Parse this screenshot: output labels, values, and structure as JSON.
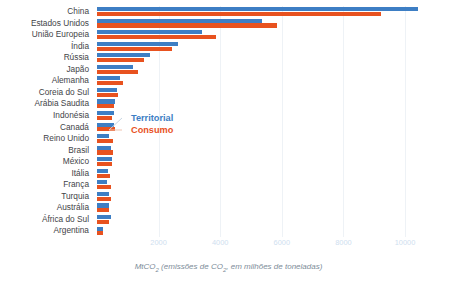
{
  "chart_data": {
    "type": "bar",
    "orientation": "horizontal",
    "title": "",
    "xlabel": "MtCO₂ (emissões de CO₂, em milhões de toneladas)",
    "ylabel": "",
    "xlim": [
      0,
      11200
    ],
    "xticks": [
      2000,
      4000,
      6000,
      8000,
      10000
    ],
    "xticklabels": [
      "2000",
      "4000",
      "6000",
      "8000",
      "10000"
    ],
    "grid": "vertical",
    "legend_position": "inside-left",
    "categories": [
      "China",
      "Estados Unidos",
      "União Europeia",
      "Índia",
      "Rússia",
      "Japão",
      "Alemanha",
      "Coreia do Sul",
      "Arábia Saudita",
      "Indonésia",
      "Canadá",
      "Reino Unido",
      "Brasil",
      "México",
      "Itália",
      "França",
      "Turquia",
      "Austrália",
      "África do Sul",
      "Argentina"
    ],
    "series": [
      {
        "name": "Territorial",
        "color": "#3d7ec4",
        "values": [
          10430,
          5350,
          3400,
          2620,
          1710,
          1180,
          760,
          640,
          570,
          560,
          560,
          400,
          470,
          480,
          350,
          330,
          400,
          400,
          450,
          200
        ]
      },
      {
        "name": "Consumo",
        "color": "#e8521f",
        "values": [
          9210,
          5830,
          3860,
          2450,
          1540,
          1340,
          850,
          680,
          540,
          480,
          600,
          530,
          510,
          500,
          430,
          450,
          440,
          400,
          400,
          210
        ]
      }
    ]
  },
  "legend": {
    "territorial_label": "Territorial",
    "consumo_label": "Consumo"
  },
  "caption": {
    "prefix": "MtCO",
    "sub1": "2",
    "middle": " (emissões de CO",
    "sub2": "2",
    "suffix": ", em milhões de toneladas)"
  },
  "colors": {
    "territorial": "#3d7ec4",
    "consumo": "#e8521f",
    "grid": "#eef2f6",
    "tick_text": "#cfe0ef",
    "label_text": "#3f4448",
    "caption_text": "#7d8c99",
    "background": "#ffffff"
  }
}
